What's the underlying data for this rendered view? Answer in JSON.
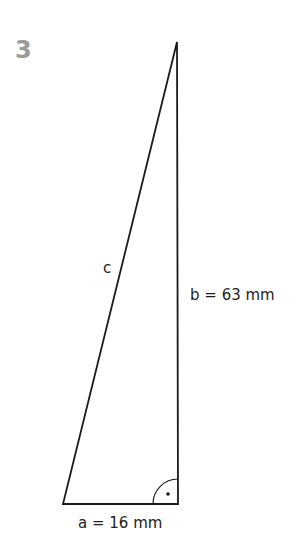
{
  "exercise_number": "3",
  "figure": {
    "type": "right-triangle",
    "labels": {
      "hypotenuse": "c",
      "side_b": "b = 63 mm",
      "side_a": "a = 16 mm"
    },
    "right_angle_marker": "arc-with-dot",
    "line_color": "#1a1a1a"
  }
}
